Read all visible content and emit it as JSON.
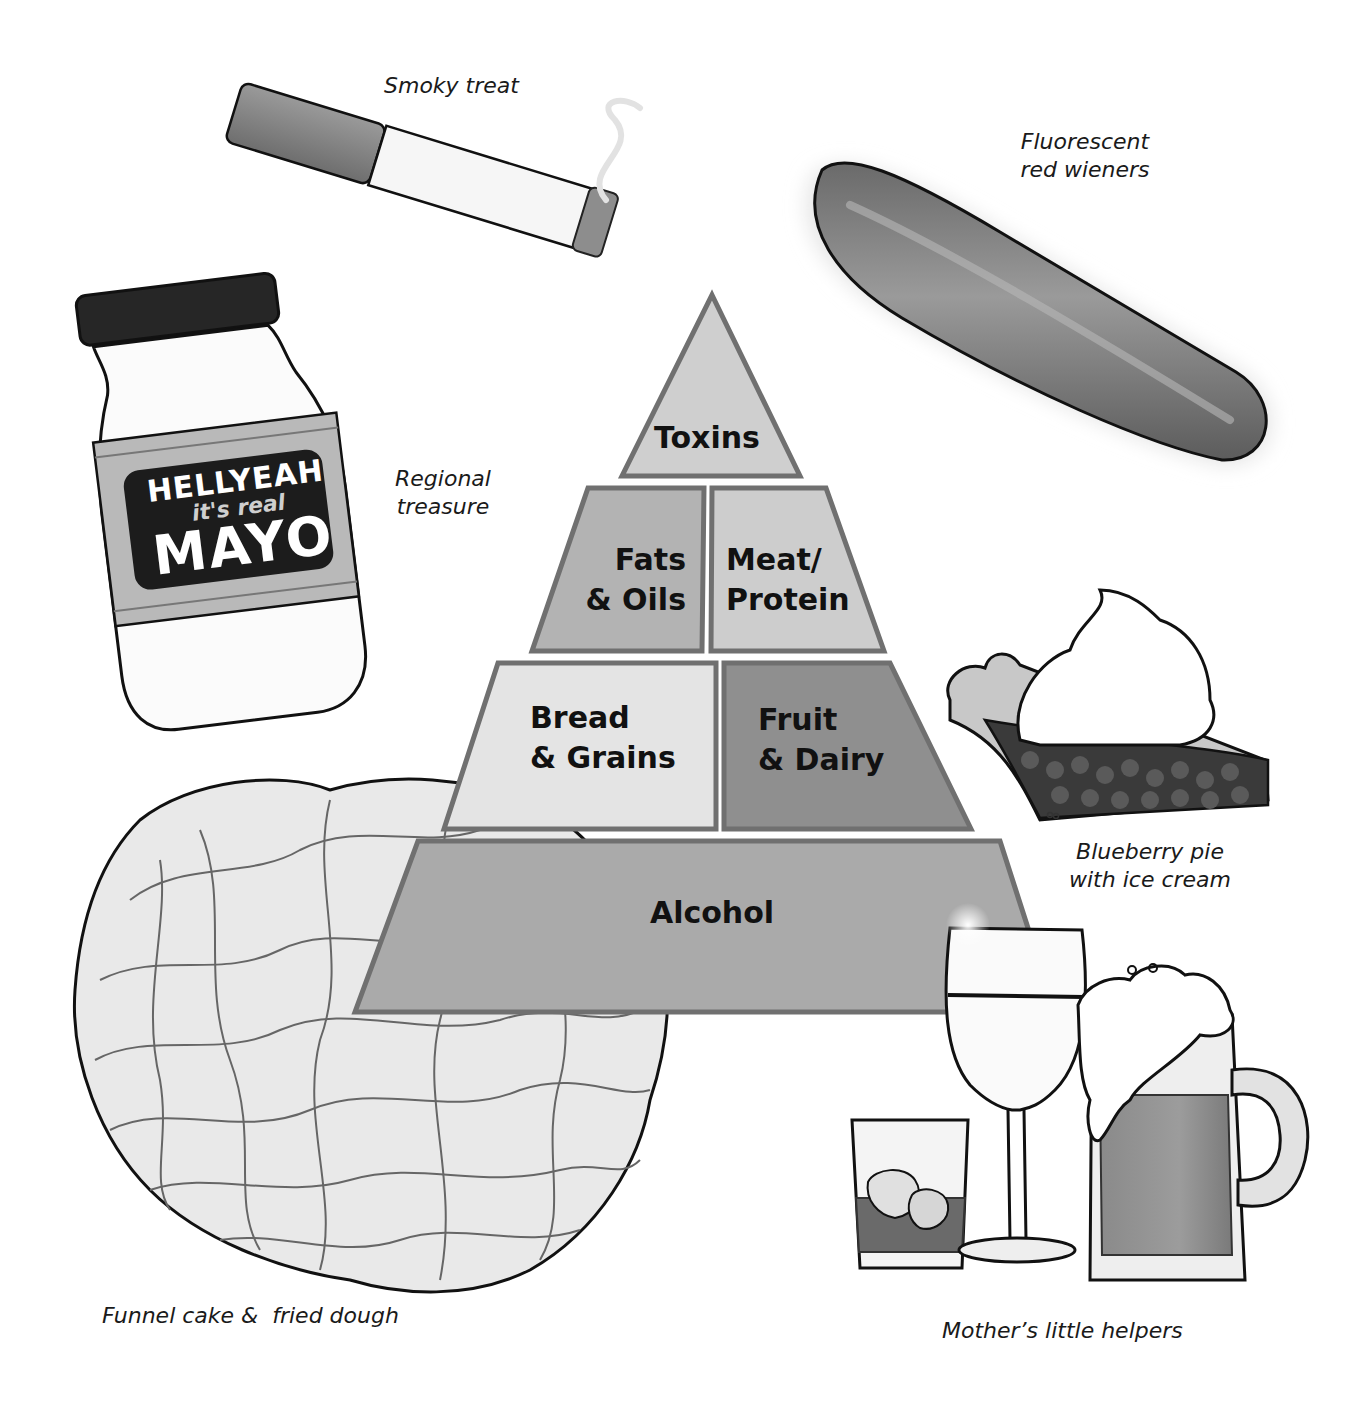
{
  "pyramid": {
    "tiers": [
      {
        "id": "toxins",
        "label": "Toxins",
        "fill": "#cfcfcf"
      },
      {
        "id": "fats",
        "label_line1": "Fats",
        "label_line2": "& Oils",
        "fill": "#b3b3b3"
      },
      {
        "id": "meat",
        "label_line1": "Meat/",
        "label_line2": "Protein",
        "fill": "#cdcdcd"
      },
      {
        "id": "bread",
        "label_line1": "Bread",
        "label_line2": "& Grains",
        "fill": "#e4e4e4"
      },
      {
        "id": "fruit",
        "label_line1": "Fruit",
        "label_line2": "& Dairy",
        "fill": "#8f8f8f"
      },
      {
        "id": "alcohol",
        "label": "Alcohol",
        "fill": "#aaaaaa"
      }
    ],
    "outline_color": "#707070"
  },
  "illustrations": {
    "cigarette": {
      "caption": "Smoky treat"
    },
    "wiener": {
      "caption_line1": "Fluorescent",
      "caption_line2": "red wieners"
    },
    "mayo": {
      "caption_line1": "Regional",
      "caption_line2": "treasure",
      "jar_text_line1": "HELLYEAH",
      "jar_text_line2": "it's real",
      "jar_text_line3": "MAYO"
    },
    "pie": {
      "caption_line1": "Blueberry pie",
      "caption_line2": "with ice cream"
    },
    "funnel_cake": {
      "caption": "Funnel cake &  fried dough"
    },
    "drinks": {
      "caption": "Mother’s little helpers"
    }
  }
}
